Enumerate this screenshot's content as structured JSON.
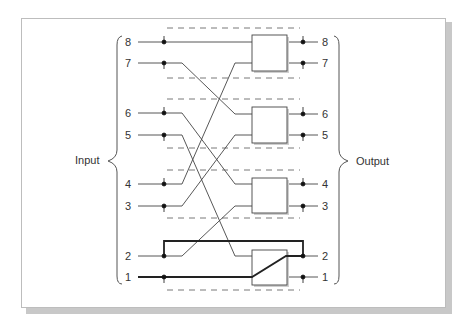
{
  "diagram": {
    "type": "switching-network",
    "input_label": "Input",
    "output_label": "Output",
    "inputs": [
      "8",
      "7",
      "6",
      "5",
      "4",
      "3",
      "2",
      "1"
    ],
    "outputs": [
      "8",
      "7",
      "6",
      "5",
      "4",
      "3",
      "2",
      "1"
    ],
    "switch_boxes": [
      {
        "id": "box-1",
        "inputs": [
          "8",
          "4"
        ],
        "outputs": [
          "8",
          "7"
        ]
      },
      {
        "id": "box-2",
        "inputs": [
          "7",
          "3"
        ],
        "outputs": [
          "6",
          "5"
        ]
      },
      {
        "id": "box-3",
        "inputs": [
          "6",
          "2"
        ],
        "outputs": [
          "4",
          "3"
        ]
      },
      {
        "id": "box-4",
        "inputs": [
          "5",
          "1"
        ],
        "outputs": [
          "2",
          "1"
        ],
        "active_path": "1 -> 2"
      }
    ],
    "highlighted_path": "Input 1 -> Output 2, with bypass loop from Input 2 to Output 2"
  }
}
